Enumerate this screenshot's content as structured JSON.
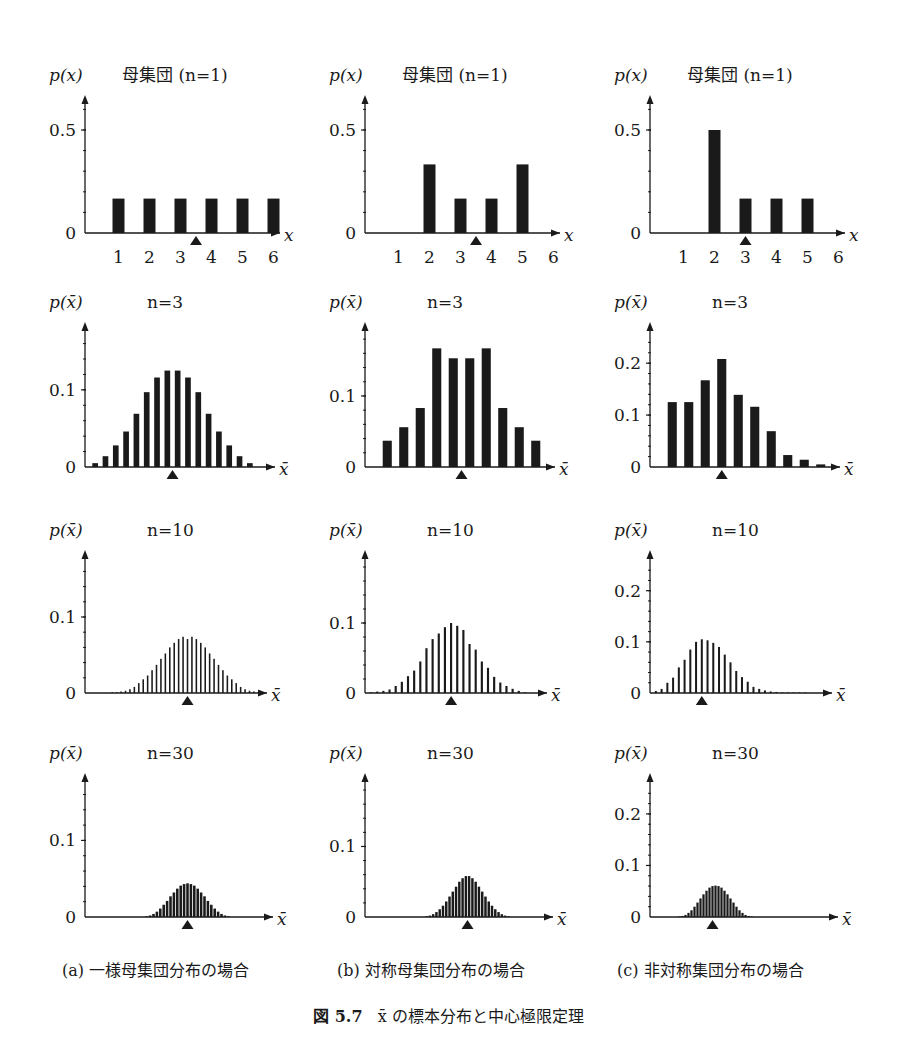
{
  "figure": {
    "number": "図 5.7",
    "title": "x̄ の標本分布と中心極限定理",
    "captions": [
      "(a) 一様母集団分布の場合",
      "(b) 対称母集団分布の場合",
      "(c) 非対称集団分布の場合"
    ]
  },
  "chart_data": [
    {
      "id": "a-n1",
      "type": "bar",
      "column": "a",
      "title": "母集団 (n=1)",
      "ylabel": "p(x)",
      "xlabel": "x",
      "categories": [
        "1",
        "2",
        "3",
        "4",
        "5",
        "6"
      ],
      "values": [
        0.167,
        0.167,
        0.167,
        0.167,
        0.167,
        0.167
      ],
      "yticks": [
        0,
        0.5
      ],
      "ylim": [
        0,
        0.65
      ],
      "mean_marker": 3.5
    },
    {
      "id": "b-n1",
      "type": "bar",
      "column": "b",
      "title": "母集団 (n=1)",
      "ylabel": "p(x)",
      "xlabel": "x",
      "categories": [
        "1",
        "2",
        "3",
        "4",
        "5",
        "6"
      ],
      "values": [
        0,
        0.333,
        0.167,
        0.167,
        0.333,
        0
      ],
      "yticks": [
        0,
        0.5
      ],
      "ylim": [
        0,
        0.65
      ],
      "mean_marker": 3.5
    },
    {
      "id": "c-n1",
      "type": "bar",
      "column": "c",
      "title": "母集団 (n=1)",
      "ylabel": "p(x)",
      "xlabel": "x",
      "categories": [
        "1",
        "2",
        "3",
        "4",
        "5",
        "6"
      ],
      "values": [
        0,
        0.5,
        0.167,
        0.167,
        0.167,
        0
      ],
      "yticks": [
        0,
        0.5
      ],
      "ylim": [
        0,
        0.65
      ],
      "mean_marker": 3.0
    },
    {
      "id": "a-n3",
      "type": "bar",
      "column": "a",
      "title": "n=3",
      "ylabel": "p(x̄)",
      "xlabel": "x̄",
      "values": [
        0.005,
        0.014,
        0.028,
        0.046,
        0.069,
        0.097,
        0.116,
        0.125,
        0.125,
        0.116,
        0.097,
        0.069,
        0.046,
        0.028,
        0.014,
        0.005
      ],
      "yticks": [
        0,
        0.1
      ],
      "ylim": [
        0,
        0.175
      ],
      "mean_index": 7.5
    },
    {
      "id": "b-n3",
      "type": "bar",
      "column": "b",
      "title": "n=3",
      "ylabel": "p(x̄)",
      "xlabel": "x̄",
      "values": [
        0.037,
        0.056,
        0.083,
        0.167,
        0.153,
        0.153,
        0.167,
        0.083,
        0.056,
        0.037
      ],
      "yticks": [
        0,
        0.1
      ],
      "ylim": [
        0,
        0.19
      ],
      "mean_index": 4.5
    },
    {
      "id": "c-n3",
      "type": "bar",
      "column": "c",
      "title": "n=3",
      "ylabel": "p(x̄)",
      "xlabel": "x̄",
      "values": [
        0.125,
        0.125,
        0.167,
        0.208,
        0.139,
        0.116,
        0.069,
        0.023,
        0.014,
        0.005
      ],
      "yticks": [
        0,
        0.1,
        0.2
      ],
      "ylim": [
        0,
        0.26
      ],
      "mean_index": 3
    },
    {
      "id": "a-n10",
      "type": "bar",
      "column": "a",
      "title": "n=10",
      "ylabel": "p(x̄)",
      "xlabel": "x̄",
      "values": [
        0.001,
        0.001,
        0.002,
        0.003,
        0.005,
        0.008,
        0.013,
        0.018,
        0.023,
        0.03,
        0.037,
        0.045,
        0.052,
        0.06,
        0.066,
        0.071,
        0.074,
        0.071,
        0.074,
        0.071,
        0.066,
        0.06,
        0.052,
        0.045,
        0.037,
        0.03,
        0.023,
        0.018,
        0.013,
        0.008,
        0.005,
        0.003,
        0.002,
        0.001,
        0.001
      ],
      "yticks": [
        0,
        0.1
      ],
      "ylim": [
        0,
        0.175
      ],
      "mean_index": 17
    },
    {
      "id": "b-n10",
      "type": "bar",
      "column": "b",
      "title": "n=10",
      "ylabel": "p(x̄)",
      "xlabel": "x̄",
      "values": [
        0.001,
        0.002,
        0.003,
        0.005,
        0.01,
        0.016,
        0.024,
        0.032,
        0.045,
        0.064,
        0.077,
        0.085,
        0.094,
        0.1,
        0.096,
        0.09,
        0.07,
        0.062,
        0.045,
        0.036,
        0.023,
        0.015,
        0.01,
        0.006,
        0.003,
        0.001
      ],
      "yticks": [
        0,
        0.1
      ],
      "ylim": [
        0,
        0.19
      ],
      "mean_index": 13
    },
    {
      "id": "c-n10",
      "type": "bar",
      "column": "c",
      "title": "n=10",
      "ylabel": "p(x̄)",
      "xlabel": "x̄",
      "values": [
        0.004,
        0.008,
        0.02,
        0.03,
        0.05,
        0.065,
        0.085,
        0.1,
        0.105,
        0.103,
        0.098,
        0.09,
        0.075,
        0.06,
        0.043,
        0.031,
        0.022,
        0.012,
        0.008,
        0.005,
        0.003,
        0.002,
        0.001,
        0.001,
        0.001,
        0.001,
        0.001
      ],
      "yticks": [
        0,
        0.1,
        0.2
      ],
      "ylim": [
        0,
        0.26
      ],
      "mean_index": 8
    },
    {
      "id": "a-n30",
      "type": "bar",
      "column": "a",
      "title": "n=30",
      "ylabel": "p(x̄)",
      "xlabel": "x̄",
      "values": [
        0.001,
        0.002,
        0.004,
        0.007,
        0.011,
        0.016,
        0.021,
        0.027,
        0.032,
        0.037,
        0.041,
        0.043,
        0.044,
        0.043,
        0.041,
        0.037,
        0.032,
        0.027,
        0.021,
        0.016,
        0.011,
        0.007,
        0.004,
        0.002,
        0.001
      ],
      "yticks": [
        0,
        0.1
      ],
      "ylim": [
        0,
        0.175
      ],
      "mean_index": 12
    },
    {
      "id": "b-n30",
      "type": "bar",
      "column": "b",
      "title": "n=30",
      "ylabel": "p(x̄)",
      "xlabel": "x̄",
      "values": [
        0.001,
        0.002,
        0.004,
        0.007,
        0.011,
        0.016,
        0.022,
        0.029,
        0.036,
        0.043,
        0.05,
        0.055,
        0.058,
        0.058,
        0.055,
        0.05,
        0.043,
        0.036,
        0.029,
        0.022,
        0.016,
        0.011,
        0.007,
        0.004,
        0.002,
        0.001
      ],
      "yticks": [
        0,
        0.1
      ],
      "ylim": [
        0,
        0.19
      ],
      "mean_index": 12.5
    },
    {
      "id": "c-n30",
      "type": "bar",
      "column": "c",
      "title": "n=30",
      "ylabel": "p(x̄)",
      "xlabel": "x̄",
      "values": [
        0.001,
        0.002,
        0.004,
        0.008,
        0.013,
        0.02,
        0.028,
        0.036,
        0.044,
        0.051,
        0.057,
        0.06,
        0.061,
        0.06,
        0.057,
        0.051,
        0.044,
        0.036,
        0.028,
        0.02,
        0.013,
        0.008,
        0.004,
        0.002,
        0.001
      ],
      "yticks": [
        0,
        0.1,
        0.2
      ],
      "ylim": [
        0,
        0.26
      ],
      "mean_index": 11
    }
  ]
}
